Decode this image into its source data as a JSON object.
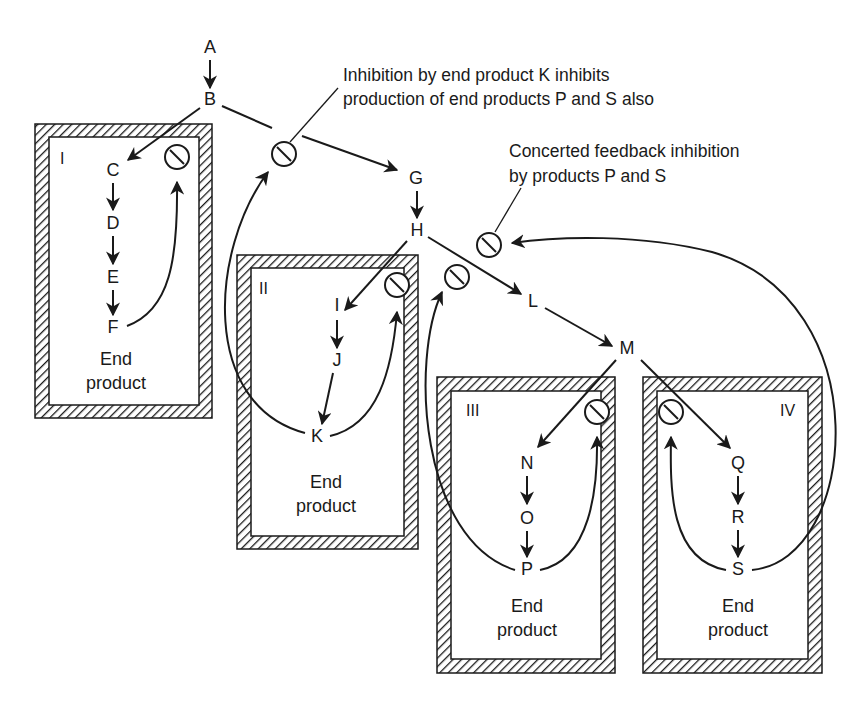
{
  "diagram": {
    "type": "metabolic-pathway-feedback-inhibition",
    "annotations": {
      "k_inhibition_line1": "Inhibition by end product K inhibits",
      "k_inhibition_line2": "production of end products P and S also",
      "concerted_line1": "Concerted feedback inhibition",
      "concerted_line2": "by products P and S"
    },
    "nodes": {
      "A": "A",
      "B": "B",
      "C": "C",
      "D": "D",
      "E": "E",
      "F": "F",
      "G": "G",
      "H": "H",
      "I": "I",
      "J": "J",
      "K": "K",
      "L": "L",
      "M": "M",
      "N": "N",
      "O": "O",
      "P": "P",
      "Q": "Q",
      "R": "R",
      "S": "S"
    },
    "compartments": [
      {
        "id": "I",
        "label": "I",
        "end_line1": "End",
        "end_line2": "product",
        "pathway": [
          "C",
          "D",
          "E",
          "F"
        ]
      },
      {
        "id": "II",
        "label": "II",
        "end_line1": "End",
        "end_line2": "product",
        "pathway": [
          "I",
          "J",
          "K"
        ]
      },
      {
        "id": "III",
        "label": "III",
        "end_line1": "End",
        "end_line2": "product",
        "pathway": [
          "N",
          "O",
          "P"
        ]
      },
      {
        "id": "IV",
        "label": "IV",
        "end_line1": "End",
        "end_line2": "product",
        "pathway": [
          "Q",
          "R",
          "S"
        ]
      }
    ],
    "edges": [
      [
        "A",
        "B"
      ],
      [
        "B",
        "C"
      ],
      [
        "C",
        "D"
      ],
      [
        "D",
        "E"
      ],
      [
        "E",
        "F"
      ],
      [
        "B",
        "G"
      ],
      [
        "G",
        "H"
      ],
      [
        "H",
        "I"
      ],
      [
        "I",
        "J"
      ],
      [
        "J",
        "K"
      ],
      [
        "H",
        "L"
      ],
      [
        "L",
        "M"
      ],
      [
        "M",
        "N"
      ],
      [
        "N",
        "O"
      ],
      [
        "O",
        "P"
      ],
      [
        "M",
        "Q"
      ],
      [
        "Q",
        "R"
      ],
      [
        "R",
        "S"
      ]
    ],
    "feedback": [
      {
        "from": "F",
        "to": "inhibitor-I"
      },
      {
        "from": "K",
        "to": "inhibitor-II"
      },
      {
        "from": "K",
        "to": "inhibitor-B-G"
      },
      {
        "from": "P",
        "to": "inhibitor-III"
      },
      {
        "from": "P",
        "to": "inhibitor-H-L"
      },
      {
        "from": "S",
        "to": "inhibitor-IV"
      },
      {
        "from": "S",
        "to": "inhibitor-concerted"
      }
    ],
    "colors": {
      "ink": "#1a1a1a",
      "background": "#ffffff"
    }
  }
}
